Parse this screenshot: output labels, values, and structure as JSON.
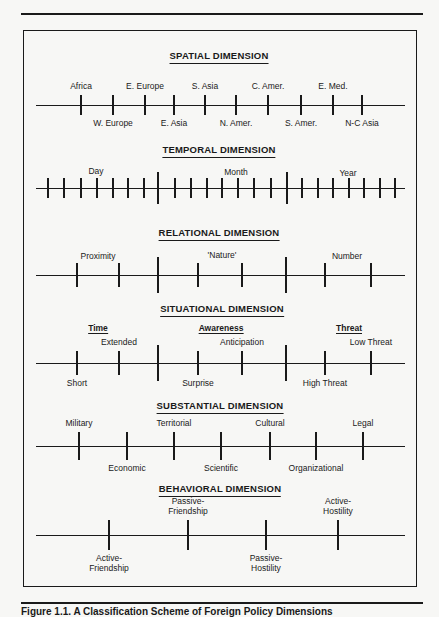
{
  "caption": "Figure 1.1. A Classification Scheme of Foreign Policy Dimensions",
  "chart_data": {
    "type": "diagram",
    "title": "A Classification Scheme of Foreign Policy Dimensions",
    "dimensions": [
      {
        "title": "SPATIAL DIMENSION",
        "title_x": 219,
        "title_y": 50,
        "axis": {
          "y": 105,
          "x1": 36,
          "x2": 405
        },
        "tick_len": [
          10,
          10
        ],
        "ticks": [
          {
            "x": 81,
            "label": "Africa",
            "pos": "above"
          },
          {
            "x": 113,
            "label": "W. Europe",
            "pos": "below"
          },
          {
            "x": 145,
            "label": "E. Europe",
            "pos": "above"
          },
          {
            "x": 174,
            "label": "E. Asia",
            "pos": "below"
          },
          {
            "x": 205,
            "label": "S. Asia",
            "pos": "above"
          },
          {
            "x": 236,
            "label": "N. Amer.",
            "pos": "below"
          },
          {
            "x": 268,
            "label": "C. Amer.",
            "pos": "above"
          },
          {
            "x": 301,
            "label": "S. Amer.",
            "pos": "below"
          },
          {
            "x": 333,
            "label": "E. Med.",
            "pos": "above"
          },
          {
            "x": 362,
            "label": "N-C Asia",
            "pos": "below"
          }
        ]
      },
      {
        "title": "TEMPORAL DIMENSION",
        "title_x": 219,
        "title_y": 144,
        "axis": {
          "y": 188,
          "x1": 36,
          "x2": 405
        },
        "tick_len": [
          10,
          10
        ],
        "segment_labels": [
          {
            "x": 96,
            "y": 166,
            "label": "Day"
          },
          {
            "x": 236,
            "y": 167,
            "label": "Month"
          },
          {
            "x": 348,
            "y": 168,
            "label": "Year"
          }
        ],
        "ticks": [
          {
            "x": 48
          },
          {
            "x": 64
          },
          {
            "x": 81
          },
          {
            "x": 97
          },
          {
            "x": 113
          },
          {
            "x": 128
          },
          {
            "x": 144
          },
          {
            "x": 158,
            "major": true
          },
          {
            "x": 175
          },
          {
            "x": 191
          },
          {
            "x": 207
          },
          {
            "x": 222
          },
          {
            "x": 238
          },
          {
            "x": 254
          },
          {
            "x": 271
          },
          {
            "x": 287,
            "major": true
          },
          {
            "x": 302
          },
          {
            "x": 318
          },
          {
            "x": 333
          },
          {
            "x": 349
          },
          {
            "x": 364
          },
          {
            "x": 380
          },
          {
            "x": 395
          }
        ]
      },
      {
        "title": "RELATIONAL DIMENSION",
        "title_x": 219,
        "title_y": 227,
        "axis": {
          "y": 275,
          "x1": 36,
          "x2": 405
        },
        "tick_len": [
          12,
          12
        ],
        "segment_labels": [
          {
            "x": 98,
            "y": 251,
            "label": "Proximity"
          },
          {
            "x": 222,
            "y": 250,
            "label": "'Nature'"
          },
          {
            "x": 347,
            "y": 251,
            "label": "Number"
          }
        ],
        "ticks": [
          {
            "x": 77
          },
          {
            "x": 119
          },
          {
            "x": 158,
            "major": true
          },
          {
            "x": 198
          },
          {
            "x": 242
          },
          {
            "x": 286,
            "major": true
          },
          {
            "x": 325
          },
          {
            "x": 371
          }
        ]
      },
      {
        "title": "SITUATIONAL DIMENSION",
        "title_x": 222,
        "title_y": 303,
        "axis": {
          "y": 363,
          "x1": 36,
          "x2": 405
        },
        "tick_len": [
          12,
          12
        ],
        "groups": [
          {
            "x": 98,
            "y": 323,
            "label": "Time"
          },
          {
            "x": 221,
            "y": 323,
            "label": "Awareness"
          },
          {
            "x": 349,
            "y": 323,
            "label": "Threat"
          }
        ],
        "ticks": [
          {
            "x": 77,
            "label": "Short",
            "pos": "below"
          },
          {
            "x": 119,
            "label": "Extended",
            "pos": "above"
          },
          {
            "x": 158,
            "major": true
          },
          {
            "x": 198,
            "label": "Surprise",
            "pos": "below"
          },
          {
            "x": 242,
            "label": "Anticipation",
            "pos": "above"
          },
          {
            "x": 286,
            "major": true
          },
          {
            "x": 325,
            "label": "High Threat",
            "pos": "below"
          },
          {
            "x": 371,
            "label": "Low Threat",
            "pos": "above"
          }
        ]
      },
      {
        "title": "SUBSTANTIAL DIMENSION",
        "title_x": 220,
        "title_y": 400,
        "axis": {
          "y": 446,
          "x1": 36,
          "x2": 405
        },
        "tick_len": [
          14,
          14
        ],
        "ticks": [
          {
            "x": 79,
            "label": "Military",
            "pos": "above"
          },
          {
            "x": 127,
            "label": "Economic",
            "pos": "below"
          },
          {
            "x": 174,
            "label": "Territorial",
            "pos": "above"
          },
          {
            "x": 221,
            "label": "Scientific",
            "pos": "below"
          },
          {
            "x": 270,
            "label": "Cultural",
            "pos": "above"
          },
          {
            "x": 316,
            "label": "Organizational",
            "pos": "below"
          },
          {
            "x": 363,
            "label": "Legal",
            "pos": "above"
          }
        ]
      },
      {
        "title": "BEHAVIORAL DIMENSION",
        "title_x": 220,
        "title_y": 483,
        "axis": {
          "y": 535,
          "x1": 36,
          "x2": 405
        },
        "tick_len": [
          15,
          15
        ],
        "ticks": [
          {
            "x": 109,
            "label": "Active-\nFriendship",
            "pos": "below"
          },
          {
            "x": 188,
            "label": "Passive-\nFriendship",
            "pos": "above"
          },
          {
            "x": 266,
            "label": "Passive-\nHostility",
            "pos": "below"
          },
          {
            "x": 338,
            "label": "Active-\nHostility",
            "pos": "above"
          }
        ]
      }
    ]
  }
}
